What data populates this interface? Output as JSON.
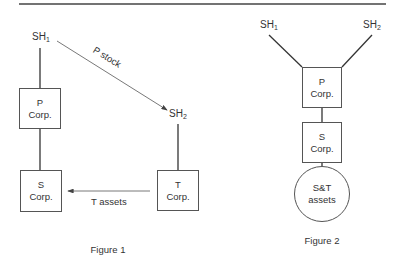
{
  "figure1": {
    "caption": "Figure 1",
    "sh1": {
      "base": "SH",
      "sub": "1"
    },
    "sh2": {
      "base": "SH",
      "sub": "2"
    },
    "p_corp": {
      "line1": "P",
      "line2": "Corp."
    },
    "s_corp": {
      "line1": "S",
      "line2": "Corp."
    },
    "t_corp": {
      "line1": "T",
      "line2": "Corp."
    },
    "arrow_p_stock": "P stock",
    "arrow_t_assets": "T assets"
  },
  "figure2": {
    "caption": "Figure 2",
    "sh1": {
      "base": "SH",
      "sub": "1"
    },
    "sh2": {
      "base": "SH",
      "sub": "2"
    },
    "p_corp": {
      "line1": "P",
      "line2": "Corp."
    },
    "s_corp": {
      "line1": "S",
      "line2": "Corp."
    },
    "assets": {
      "line1": "S&T",
      "line2": "assets"
    }
  }
}
